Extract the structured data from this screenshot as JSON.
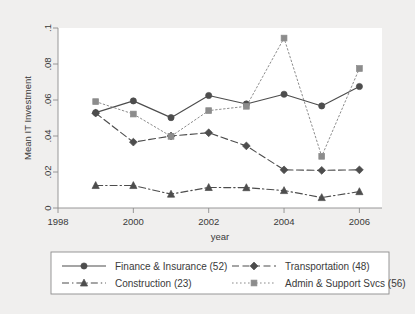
{
  "chart_data": {
    "type": "line",
    "title": "",
    "xlabel": "year",
    "ylabel": "Mean IT Investment",
    "xlim": [
      1998,
      2006.6
    ],
    "ylim": [
      0,
      0.1
    ],
    "xticks": [
      1998,
      2000,
      2002,
      2004,
      2006
    ],
    "xtick_labels": [
      "1998",
      "2000",
      "2002",
      "2004",
      "2006"
    ],
    "yticks": [
      0,
      0.02,
      0.04,
      0.06,
      0.08,
      0.1
    ],
    "ytick_labels": [
      "0",
      ".02",
      ".04",
      ".06",
      ".08",
      ".1"
    ],
    "grid": false,
    "legend_position": "bottom-outside",
    "x": [
      1999,
      2000,
      2001,
      2002,
      2003,
      2004,
      2005,
      2006
    ],
    "series": [
      {
        "name": "Finance & Insurance (52)",
        "count": 52,
        "marker": "circle",
        "dash": "solid",
        "color": "#4d4d4d",
        "values": [
          0.053,
          0.0595,
          0.0502,
          0.0625,
          0.0578,
          0.0632,
          0.0567,
          0.0675
        ]
      },
      {
        "name": "Transportation (48)",
        "count": 48,
        "marker": "diamond",
        "dash": "dash",
        "color": "#4d4d4d",
        "values": [
          0.0527,
          0.0366,
          0.04,
          0.0418,
          0.0345,
          0.0212,
          0.0209,
          0.0212
        ]
      },
      {
        "name": "Construction (23)",
        "count": 23,
        "marker": "triangle",
        "dash": "dash-dot",
        "color": "#4d4d4d",
        "values": [
          0.0125,
          0.0125,
          0.0077,
          0.0114,
          0.0113,
          0.0097,
          0.0058,
          0.0091
        ]
      },
      {
        "name": "Admin & Support Svcs (56)",
        "count": 56,
        "marker": "square",
        "dash": "dot",
        "color": "#8c8c8c",
        "values": [
          0.0591,
          0.0522,
          0.0398,
          0.0541,
          0.0565,
          0.0944,
          0.0287,
          0.0775
        ]
      }
    ]
  },
  "legend": {
    "entries": [
      {
        "label": "Finance & Insurance (52)"
      },
      {
        "label": "Transportation (48)"
      },
      {
        "label": "Construction (23)"
      },
      {
        "label": "Admin & Support Svcs (56)"
      }
    ]
  },
  "colors": {
    "panel_background": "#f0efee",
    "plot_background": "#ffffff",
    "axis": "#8d8d8d",
    "text": "#3a3a3a",
    "dark_series": "#4d4d4d",
    "light_series": "#8c8c8c"
  }
}
